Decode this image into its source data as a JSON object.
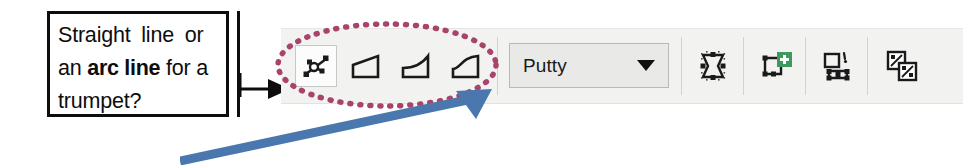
{
  "callout": {
    "line1_text": "Straight line or",
    "line2_prefix": "an ",
    "line2_bold": "arc line",
    "line2_suffix": " for a",
    "line3_text": "trumpet?"
  },
  "toolbar": {
    "background_color": "#f2f2f0",
    "tools": [
      {
        "name": "edit-nodes-tool",
        "tooltip": "Edit nodes",
        "selected": true
      },
      {
        "name": "straight-line-shape-tool",
        "tooltip": "Straight line",
        "selected": false
      },
      {
        "name": "concave-curve-shape-tool",
        "tooltip": "Concave curve",
        "selected": false
      },
      {
        "name": "s-curve-shape-tool",
        "tooltip": "S curve",
        "selected": false
      }
    ],
    "dropdown": {
      "name": "putty-dropdown",
      "value": "Putty",
      "placeholder": "Putty",
      "caret_icon": "chevron-down-icon"
    },
    "actions": [
      {
        "name": "node-bounding-box-button",
        "icon": "node-bounding-box-icon",
        "badge": ""
      },
      {
        "name": "add-node-button",
        "icon": "add-node-icon",
        "badge": "+",
        "badge_color": "#3c9a5f"
      },
      {
        "name": "convert-shape-button",
        "icon": "convert-shape-icon",
        "badge": ""
      },
      {
        "name": "duplicate-curves-button",
        "icon": "duplicate-curves-icon",
        "badge": ""
      }
    ]
  },
  "annotations": {
    "ellipse": {
      "name": "highlight-ellipse",
      "color": "#a8446b",
      "style": "dotted"
    },
    "black_arrow": {
      "name": "callout-pointer-arrow",
      "color": "#0d0d0d"
    },
    "blue_arrow": {
      "name": "dropdown-pointer-arrow",
      "color": "#4a77ad"
    }
  }
}
